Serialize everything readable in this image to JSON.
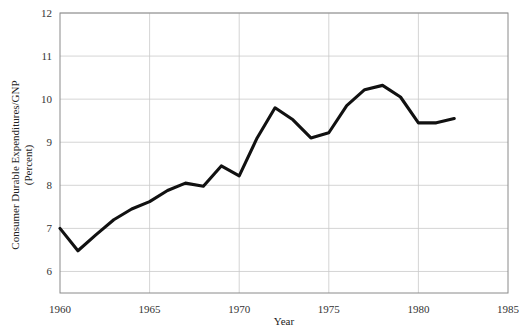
{
  "chart_data": {
    "type": "line",
    "title": "",
    "xlabel": "Year",
    "ylabel": "Consumer Durable Expenditures/GNP",
    "ylabel_line2": "(Percent)",
    "xlim": [
      1960,
      1985
    ],
    "ylim": [
      5.5,
      12
    ],
    "xticks": [
      1960,
      1965,
      1970,
      1975,
      1980,
      1985
    ],
    "yticks": [
      6,
      7,
      8,
      9,
      10,
      11,
      12
    ],
    "grid": true,
    "legend": false,
    "series": [
      {
        "name": "Consumer Durable Expenditures/GNP",
        "color": "#111111",
        "x": [
          1960,
          1961,
          1962,
          1963,
          1964,
          1965,
          1966,
          1967,
          1968,
          1969,
          1970,
          1971,
          1972,
          1973,
          1974,
          1975,
          1976,
          1977,
          1978,
          1979,
          1980,
          1981,
          1982
        ],
        "values": [
          7.0,
          6.48,
          6.85,
          7.2,
          7.45,
          7.62,
          7.88,
          8.05,
          7.98,
          8.45,
          8.22,
          9.1,
          9.8,
          9.52,
          9.1,
          9.22,
          9.85,
          10.22,
          10.32,
          10.05,
          9.45,
          9.45,
          9.55
        ]
      }
    ]
  },
  "axis_labels": {
    "x_ticks": [
      "1960",
      "1965",
      "1970",
      "1975",
      "1980",
      "1985"
    ],
    "y_ticks": [
      "6",
      "7",
      "8",
      "9",
      "10",
      "11",
      "12"
    ],
    "x_title": "Year",
    "y_title_line1": "Consumer Durable Expenditures/GNP",
    "y_title_line2": "(Percent)"
  },
  "colors": {
    "line": "#111111",
    "grid": "#c9c9c9",
    "axis": "#8a8a8a",
    "background": "#ffffff",
    "text": "#333333"
  }
}
